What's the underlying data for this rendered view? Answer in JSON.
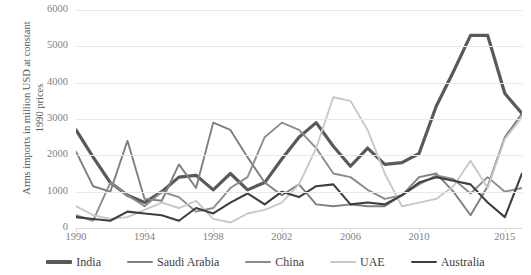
{
  "chart_data": {
    "type": "line",
    "title": "",
    "xlabel": "",
    "ylabel": "Arms imports in million USD at constant\n1990 prices",
    "ylim": [
      0,
      6000
    ],
    "ytick_values": [
      0,
      1000,
      2000,
      3000,
      4000,
      5000,
      6000
    ],
    "ytick_labels": [
      "0",
      "1000",
      "2000",
      "3000",
      "4000",
      "5000",
      "6000"
    ],
    "xlim": [
      1990,
      2016
    ],
    "xtick_values": [
      1990,
      1994,
      1998,
      2002,
      2006,
      2010,
      2015
    ],
    "xtick_labels": [
      "1990",
      "1994",
      "1998",
      "2002",
      "2006",
      "2010",
      "2015"
    ],
    "grid": true,
    "legend_position": "bottom",
    "x": [
      1990,
      1991,
      1992,
      1993,
      1994,
      1995,
      1996,
      1997,
      1998,
      1999,
      2000,
      2001,
      2002,
      2003,
      2004,
      2005,
      2006,
      2007,
      2008,
      2009,
      2010,
      2011,
      2012,
      2013,
      2014,
      2015,
      2016
    ],
    "series": [
      {
        "name": "India",
        "color": "#595959",
        "width": 3.2,
        "values": [
          2700,
          1950,
          1250,
          900,
          700,
          1000,
          1400,
          1450,
          1050,
          1500,
          1050,
          1250,
          1900,
          2500,
          2900,
          2250,
          1700,
          2200,
          1750,
          1800,
          2050,
          3350,
          4300,
          5300,
          5300,
          3700,
          3150
        ]
      },
      {
        "name": "Saudi Arabia",
        "color": "#7f7f7f",
        "width": 1.9,
        "values": [
          2100,
          1150,
          1000,
          2400,
          800,
          750,
          1750,
          1100,
          2900,
          2700,
          1950,
          1250,
          900,
          1200,
          650,
          600,
          650,
          600,
          600,
          900,
          1400,
          1500,
          1000,
          350,
          1150,
          2500,
          3150
        ]
      },
      {
        "name": "China",
        "color": "#8c8c8c",
        "width": 1.9,
        "values": [
          350,
          200,
          1250,
          900,
          600,
          1000,
          850,
          450,
          550,
          1100,
          1400,
          2500,
          2900,
          2700,
          2200,
          1500,
          1400,
          1050,
          800,
          900,
          1200,
          1450,
          1350,
          950,
          1400,
          1000,
          1100
        ]
      },
      {
        "name": "UAE",
        "color": "#c8c8c8",
        "width": 1.9,
        "values": [
          600,
          350,
          250,
          300,
          500,
          700,
          550,
          750,
          250,
          150,
          400,
          500,
          700,
          1200,
          2200,
          3600,
          3500,
          2700,
          1500,
          600,
          700,
          800,
          1150,
          1850,
          1100,
          2450,
          3050
        ]
      },
      {
        "name": "Australia",
        "color": "#3f3f3f",
        "width": 2.1,
        "values": [
          300,
          250,
          200,
          450,
          400,
          350,
          200,
          550,
          400,
          700,
          950,
          650,
          1000,
          850,
          1150,
          1200,
          650,
          700,
          650,
          900,
          1250,
          1400,
          1300,
          1200,
          700,
          300,
          1500
        ]
      }
    ]
  },
  "legend": {
    "items": [
      {
        "label": "India"
      },
      {
        "label": "Saudi Arabia"
      },
      {
        "label": "China"
      },
      {
        "label": "UAE"
      },
      {
        "label": "Australia"
      }
    ]
  }
}
